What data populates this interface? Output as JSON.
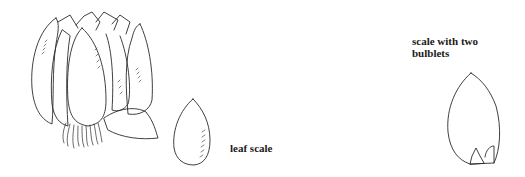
{
  "labels": {
    "leaf_scale": "leaf scale",
    "scale_two_bulblets_line1": "scale with two",
    "scale_two_bulblets_line2": "bulblets"
  },
  "figures": [
    {
      "name": "bulb",
      "description": "lily bulb with overlapping scales and roots"
    },
    {
      "name": "leaf-scale",
      "description": "single leaf scale"
    },
    {
      "name": "scale-with-bulblets",
      "description": "scale bearing two bulblets at base"
    }
  ],
  "colors": {
    "line": "#2a2a2a",
    "background": "#ffffff"
  }
}
